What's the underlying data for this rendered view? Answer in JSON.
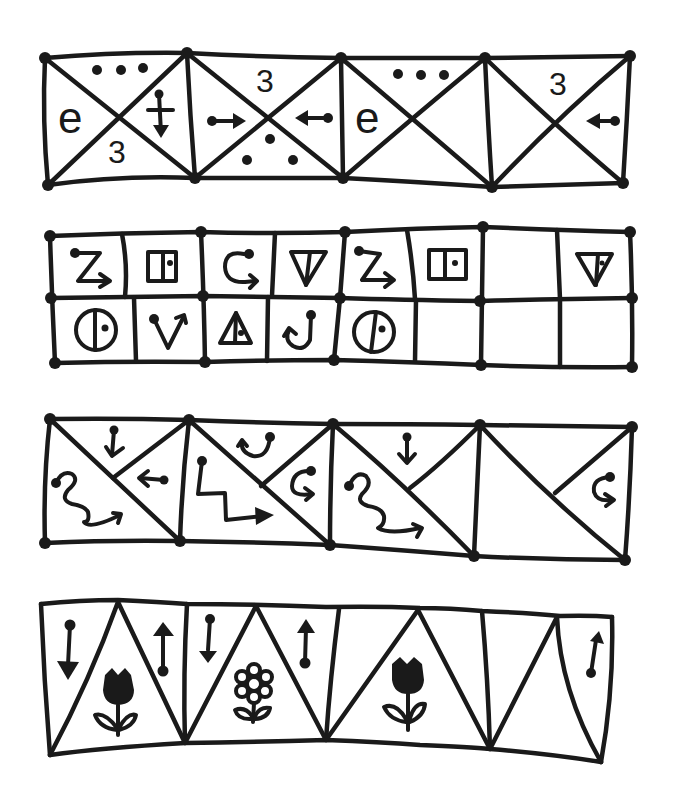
{
  "worksheet": {
    "ink_color": "#1a1a1a",
    "paper_color": "#ffffff",
    "rows": [
      {
        "id": "row-1",
        "type": "square-with-x",
        "cells": [
          {
            "top": "dots-3",
            "left": "e",
            "right": "arrow-down-crossed",
            "bottom": "3"
          },
          {
            "top": "3",
            "left": "arrow-right",
            "right": "arrow-left",
            "bottom": "dots-triangle"
          },
          {
            "top": "dots-3",
            "left": "e",
            "right": "",
            "bottom": ""
          },
          {
            "top": "3",
            "left": "",
            "right": "arrow-left",
            "bottom": ""
          }
        ],
        "labels": {
          "e": "e",
          "three": "3"
        }
      },
      {
        "id": "row-2",
        "type": "grid-2x8",
        "top": [
          "z-arrow",
          "door",
          "c-arrow",
          "triangle-down-dot",
          "z-arrow",
          "door",
          "",
          "triangle-down-dot"
        ],
        "bottom": [
          "circle-dot",
          "v-arrow",
          "triangle-up-dot",
          "j-hook",
          "circle-dot",
          "",
          "",
          ""
        ]
      },
      {
        "id": "row-3",
        "type": "diagonal-split",
        "cells": [
          {
            "top": "arrow-down",
            "right": "arrow-left",
            "left": "wave-arrow"
          },
          {
            "top": "u-hook",
            "right": "c-hook",
            "left": "zigzag-arrow"
          },
          {
            "top": "arrow-down",
            "right": "",
            "left": "wave-arrow"
          },
          {
            "top": "",
            "right": "c-hook",
            "left": ""
          }
        ]
      },
      {
        "id": "row-4",
        "type": "triangles",
        "cells": [
          {
            "upper": "arrow-down",
            "lower": "tulip"
          },
          {
            "upper": "arrow-up",
            "lower": ""
          },
          {
            "upper": "arrow-down",
            "lower": "flower"
          },
          {
            "upper": "arrow-up",
            "lower": ""
          },
          {
            "upper": "",
            "lower": "tulip"
          },
          {
            "upper": "",
            "lower": ""
          },
          {
            "upper": "",
            "lower": ""
          },
          {
            "upper": "arrow-up",
            "lower": ""
          }
        ]
      }
    ]
  }
}
